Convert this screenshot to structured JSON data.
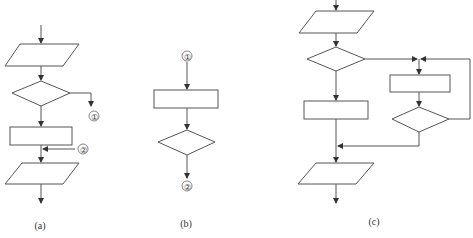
{
  "figure": {
    "panels": [
      {
        "id": "a",
        "caption": "(a)",
        "shapes": [
          "input-output parallelogram",
          "decision diamond",
          "process rectangle",
          "input-output parallelogram"
        ],
        "connectors": {
          "out_label": "1",
          "in_label": "2"
        }
      },
      {
        "id": "b",
        "caption": "(b)",
        "shapes": [
          "process rectangle",
          "decision diamond"
        ],
        "connectors": {
          "in_label": "1",
          "out_label": "2"
        }
      },
      {
        "id": "c",
        "caption": "(c)",
        "shapes": [
          "input-output parallelogram",
          "decision diamond",
          "process rectangle",
          "process rectangle",
          "decision diamond",
          "input-output parallelogram"
        ]
      }
    ],
    "labels": {
      "a_conn_out": "①",
      "a_conn_in": "②",
      "b_conn_in": "①",
      "b_conn_out": "②",
      "a_caption": "(a)",
      "b_caption": "(b)",
      "c_caption": "(c)"
    },
    "colors": {
      "stroke": "#555555",
      "text": "#333333",
      "background": "#ffffff"
    }
  }
}
